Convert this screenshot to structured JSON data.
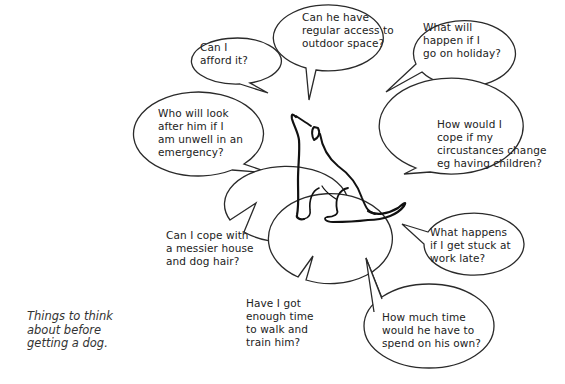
{
  "diagram": {
    "type": "mind-map",
    "center": "dog-illustration",
    "caption": "Things to think\nabout before\ngetting a dog.",
    "colors": {
      "background": "#ffffff",
      "outline": "#2a2a2a",
      "text": "#222222"
    },
    "bubbles": [
      {
        "id": "afford",
        "text": "Can I\nafford it?"
      },
      {
        "id": "outdoor",
        "text": "Can he have\nregular access to\noutdoor space?"
      },
      {
        "id": "holiday",
        "text": "What will\nhappen if I\ngo on holiday?"
      },
      {
        "id": "unwell",
        "text": "Who will look\nafter him if I\nam unwell in an\nemergency?"
      },
      {
        "id": "circumstances",
        "text": "How would I\ncope if my\ncircustances change\neg having children?"
      },
      {
        "id": "work-late",
        "text": "What happens\nif I get stuck at\nwork late?"
      },
      {
        "id": "messier-house",
        "text": "Can I cope with\na messier house\nand dog hair?"
      },
      {
        "id": "walk-train",
        "text": "Have I got\nenough time\nto walk and\ntrain him?"
      },
      {
        "id": "on-his-own",
        "text": "How much time\nwould he have to\nspend on his own?"
      }
    ]
  }
}
